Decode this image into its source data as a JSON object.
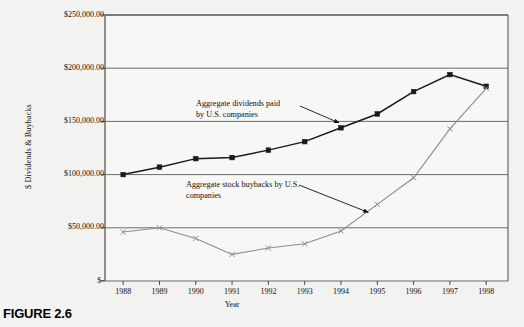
{
  "figure": {
    "caption": "FIGURE 2.6"
  },
  "chart_data": {
    "type": "line",
    "title": "",
    "xlabel": "Year",
    "ylabel": "$ Dividends & Buybacks",
    "x": [
      1988,
      1989,
      1990,
      1991,
      1992,
      1993,
      1994,
      1995,
      1996,
      1997,
      1998
    ],
    "categories": [
      "1988",
      "1989",
      "1990",
      "1991",
      "1992",
      "1993",
      "1994",
      "1995",
      "1996",
      "1997",
      "1998"
    ],
    "xlim": [
      1987.5,
      1998.6
    ],
    "ylim": [
      0,
      250000
    ],
    "yticks": [
      0,
      50000,
      100000,
      150000,
      200000,
      250000
    ],
    "ytick_labels": [
      "$-",
      "$50,000.00",
      "$100,000.00",
      "$150,000.00",
      "$200,000.00",
      "$250,000.00"
    ],
    "grid": true,
    "grid_axis": "y",
    "legend": "none",
    "series": [
      {
        "name": "Aggregate dividends paid by U.S. companies",
        "color": "#1a1a1a",
        "marker": "square",
        "values": [
          100000,
          107000,
          115000,
          116000,
          123000,
          131000,
          144000,
          157000,
          178000,
          194000,
          183000
        ]
      },
      {
        "name": "Aggregate stock buybacks by U.S. companies",
        "color": "#8c8c8c",
        "marker": "x",
        "values": [
          46000,
          50000,
          40000,
          25000,
          31000,
          35000,
          47000,
          72000,
          97000,
          143000,
          181000
        ]
      }
    ],
    "annotations": [
      {
        "id": "dividends",
        "text": "Aggregate dividends paid\nby U.S. companies",
        "points_to_year": 1994,
        "points_to_value": 144000
      },
      {
        "id": "buybacks",
        "text": "Aggregate stock buybacks by U.S.\ncompanies",
        "points_to_year": 1995,
        "points_to_value": 72000
      }
    ]
  },
  "colors": {
    "background": "#f2f2f0",
    "axis": "#4a4a4a",
    "grid": "#6b6b6b",
    "series_dividends": "#1a1a1a",
    "series_buybacks": "#8c8c8c",
    "text": "#111111"
  }
}
